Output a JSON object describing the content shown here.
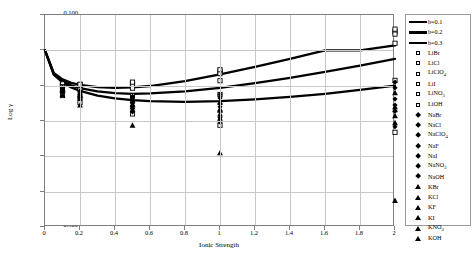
{
  "chart_data": {
    "type": "scatter",
    "title": "",
    "xlabel": "Ionic Strength",
    "ylabel": "Log γ",
    "xlim": [
      0,
      2
    ],
    "ylim": [
      -0.5,
      0.1
    ],
    "xticks": [
      "0",
      "0.2",
      "0.4",
      "0.6",
      "0.8",
      "1",
      "1.2",
      "1.4",
      "1.6",
      "1.8",
      "2"
    ],
    "yticks": [
      "0.100",
      "0.000",
      "-0.100",
      "-0.200",
      "-0.300",
      "-0.400",
      "-0.500"
    ],
    "grid": true,
    "legend_position": "right",
    "series": [
      {
        "name": "b=0.1",
        "marker": "line",
        "x": [
          0.0,
          0.05,
          0.1,
          0.15,
          0.2,
          0.3,
          0.4,
          0.5,
          0.6,
          0.8,
          1.0,
          1.2,
          1.4,
          1.6,
          1.8,
          2.0
        ],
        "values": [
          0.0,
          -0.069,
          -0.091,
          -0.105,
          -0.115,
          -0.128,
          -0.136,
          -0.141,
          -0.144,
          -0.146,
          -0.144,
          -0.139,
          -0.132,
          -0.123,
          -0.112,
          -0.1
        ]
      },
      {
        "name": "b=0.2",
        "marker": "line",
        "x": [
          0.0,
          0.05,
          0.1,
          0.15,
          0.2,
          0.3,
          0.4,
          0.5,
          0.6,
          0.8,
          1.0,
          1.2,
          1.4,
          1.6,
          1.8,
          2.0
        ],
        "values": [
          0.0,
          -0.067,
          -0.087,
          -0.099,
          -0.107,
          -0.116,
          -0.121,
          -0.123,
          -0.122,
          -0.116,
          -0.106,
          -0.093,
          -0.078,
          -0.061,
          -0.043,
          -0.024
        ]
      },
      {
        "name": "b=0.3",
        "marker": "line",
        "x": [
          0.0,
          0.05,
          0.1,
          0.15,
          0.2,
          0.3,
          0.4,
          0.5,
          0.6,
          0.8,
          1.0,
          1.2,
          1.4,
          1.6,
          1.8,
          2.0
        ],
        "values": [
          0.0,
          -0.064,
          -0.082,
          -0.092,
          -0.098,
          -0.104,
          -0.106,
          -0.105,
          -0.101,
          -0.087,
          -0.068,
          -0.047,
          -0.024,
          0.0,
          0.0,
          0.014
        ]
      },
      {
        "name": "LiBr",
        "marker": "square",
        "x": [
          0.1,
          0.2,
          0.5,
          1.0,
          2.0
        ],
        "values": [
          -0.096,
          -0.097,
          -0.093,
          -0.06,
          0.053
        ]
      },
      {
        "name": "LiCl",
        "marker": "square",
        "x": [
          0.1,
          0.2,
          0.5,
          1.0,
          2.0
        ],
        "values": [
          -0.1,
          -0.104,
          -0.107,
          -0.086,
          0.02
        ]
      },
      {
        "name": "LiClO₄",
        "marker": "square",
        "x": [
          0.1,
          0.2,
          0.5,
          1.0,
          2.0
        ],
        "values": [
          -0.097,
          -0.099,
          -0.096,
          -0.066,
          0.046
        ]
      },
      {
        "name": "LiI",
        "marker": "square",
        "x": [
          0.1,
          0.2,
          0.5,
          1.0,
          2.0
        ],
        "values": [
          -0.095,
          -0.096,
          -0.09,
          -0.055,
          0.06
        ]
      },
      {
        "name": "LiNO₃",
        "marker": "square",
        "x": [
          0.1,
          0.2,
          0.5,
          1.0,
          2.0
        ],
        "values": [
          -0.103,
          -0.112,
          -0.128,
          -0.125,
          -0.085
        ]
      },
      {
        "name": "LiOH",
        "marker": "square",
        "x": [
          0.1,
          0.2,
          0.5,
          1.0,
          2.0
        ],
        "values": [
          -0.128,
          -0.148,
          -0.18,
          -0.212,
          -0.232
        ]
      },
      {
        "name": "NaBr",
        "marker": "diamond",
        "x": [
          0.1,
          0.2,
          0.5,
          1.0,
          2.0
        ],
        "values": [
          -0.106,
          -0.118,
          -0.136,
          -0.135,
          -0.106
        ]
      },
      {
        "name": "NaCl",
        "marker": "diamond",
        "x": [
          0.1,
          0.2,
          0.5,
          1.0,
          2.0
        ],
        "values": [
          -0.109,
          -0.123,
          -0.145,
          -0.152,
          -0.138
        ]
      },
      {
        "name": "NaClO₄",
        "marker": "diamond",
        "x": [
          0.1,
          0.2,
          0.5,
          1.0,
          2.0
        ],
        "values": [
          -0.11,
          -0.125,
          -0.15,
          -0.16,
          -0.155
        ]
      },
      {
        "name": "NaF",
        "marker": "diamond",
        "x": [
          0.1,
          0.2,
          0.5,
          1.0
        ],
        "values": [
          -0.114,
          -0.132,
          -0.165,
          -0.19
        ]
      },
      {
        "name": "NaI",
        "marker": "diamond",
        "x": [
          0.1,
          0.2,
          0.5,
          1.0,
          2.0
        ],
        "values": [
          -0.104,
          -0.115,
          -0.13,
          -0.125,
          -0.09
        ]
      },
      {
        "name": "NaNO₃",
        "marker": "diamond",
        "x": [
          0.1,
          0.2,
          0.5,
          1.0,
          2.0
        ],
        "values": [
          -0.117,
          -0.138,
          -0.174,
          -0.203,
          -0.216
        ]
      },
      {
        "name": "NaOH",
        "marker": "diamond",
        "x": [
          0.1,
          0.2,
          0.5,
          1.0,
          2.0
        ],
        "values": [
          -0.112,
          -0.129,
          -0.157,
          -0.172,
          -0.172
        ]
      },
      {
        "name": "KBr",
        "marker": "triangle",
        "x": [
          0.1,
          0.2,
          0.5,
          1.0,
          2.0
        ],
        "values": [
          -0.112,
          -0.13,
          -0.16,
          -0.18,
          -0.185
        ]
      },
      {
        "name": "KCl",
        "marker": "triangle",
        "x": [
          0.1,
          0.2,
          0.5,
          1.0,
          2.0
        ],
        "values": [
          -0.114,
          -0.134,
          -0.167,
          -0.192,
          -0.205
        ]
      },
      {
        "name": "KF",
        "marker": "triangle",
        "x": [
          0.1,
          0.2,
          0.5,
          1.0,
          2.0
        ],
        "values": [
          -0.11,
          -0.126,
          -0.152,
          -0.166,
          -0.16
        ]
      },
      {
        "name": "KI",
        "marker": "triangle",
        "x": [
          0.1,
          0.2,
          0.5,
          1.0,
          2.0
        ],
        "values": [
          -0.11,
          -0.127,
          -0.155,
          -0.17,
          -0.168
        ]
      },
      {
        "name": "KNO₃",
        "marker": "triangle",
        "x": [
          0.1,
          0.2,
          0.5,
          1.0,
          2.0
        ],
        "values": [
          -0.126,
          -0.155,
          -0.212,
          -0.29,
          -0.425
        ]
      },
      {
        "name": "KOH",
        "marker": "triangle",
        "x": [
          0.1,
          0.2,
          0.5,
          1.0,
          2.0
        ],
        "values": [
          -0.108,
          -0.121,
          -0.142,
          -0.146,
          -0.12
        ]
      }
    ]
  },
  "legend": {
    "entries": [
      {
        "label": "b=0.1",
        "key": "line"
      },
      {
        "label": "b=0.2",
        "key": "line"
      },
      {
        "label": "b=0.3",
        "key": "line"
      },
      {
        "label": "LiBr",
        "key": "square"
      },
      {
        "label": "LiCl",
        "key": "square"
      },
      {
        "label": "LiClO4",
        "key": "square",
        "base": "LiClO",
        "sub": "4"
      },
      {
        "label": "LiI",
        "key": "square"
      },
      {
        "label": "LiNO3",
        "key": "square",
        "base": "LiNO",
        "sub": "3"
      },
      {
        "label": "LiOH",
        "key": "square"
      },
      {
        "label": "NaBr",
        "key": "diamond"
      },
      {
        "label": "NaCl",
        "key": "diamond"
      },
      {
        "label": "NaClO4",
        "key": "diamond",
        "base": "NaClO",
        "sub": "4"
      },
      {
        "label": "NaF",
        "key": "diamond"
      },
      {
        "label": "NaI",
        "key": "diamond"
      },
      {
        "label": "NaNO3",
        "key": "diamond",
        "base": "NaNO",
        "sub": "3"
      },
      {
        "label": "NaOH",
        "key": "diamond"
      },
      {
        "label": "KBr",
        "key": "triangle"
      },
      {
        "label": "KCl",
        "key": "triangle"
      },
      {
        "label": "KF",
        "key": "triangle"
      },
      {
        "label": "KI",
        "key": "triangle"
      },
      {
        "label": "KNO3",
        "key": "triangle",
        "base": "KNO",
        "sub": "3"
      },
      {
        "label": "KOH",
        "key": "triangle"
      }
    ]
  },
  "colors": {
    "curve": "#000000",
    "marker": "#000000",
    "grid": "#c8c8c8",
    "frame": "#7f7f7f",
    "background": "#ffffff"
  }
}
